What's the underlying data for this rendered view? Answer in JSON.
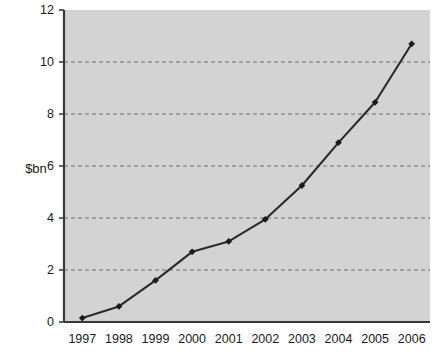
{
  "chart_data": {
    "type": "line",
    "title": "",
    "subtitle": "",
    "xlabel": "",
    "ylabel": "$bn",
    "categories": [
      "1997",
      "1998",
      "1999",
      "2000",
      "2001",
      "2002",
      "2003",
      "2004",
      "2005",
      "2006"
    ],
    "values": [
      0.15,
      0.6,
      1.6,
      2.7,
      3.1,
      3.95,
      5.25,
      6.9,
      8.45,
      10.7
    ],
    "series": [
      {
        "name": "",
        "values": [
          0.15,
          0.6,
          1.6,
          2.7,
          3.1,
          3.95,
          5.25,
          6.9,
          8.45,
          10.7
        ]
      }
    ],
    "ylim": [
      0,
      12
    ],
    "yticks": [
      0,
      2,
      4,
      6,
      8,
      10,
      12
    ],
    "ytick_labels": [
      "0",
      "2",
      "4",
      "6",
      "8",
      "10",
      "12"
    ],
    "xtick_labels": [
      "1997",
      "1998",
      "1999",
      "2000",
      "2001",
      "2002",
      "2003",
      "2004",
      "2005",
      "2006"
    ],
    "grid": true,
    "grid_style": "dashed-horizontal",
    "legend": false,
    "legend_position": "none",
    "marker": "diamond",
    "colors": {
      "plot_background": "#d3d3d3",
      "page_background": "#ffffff",
      "line": "#2b2b2b",
      "marker": "#1c1c1c",
      "gridline": "#6f6f6f",
      "axis": "#3a3a3a",
      "text": "#1a1a1a"
    }
  }
}
